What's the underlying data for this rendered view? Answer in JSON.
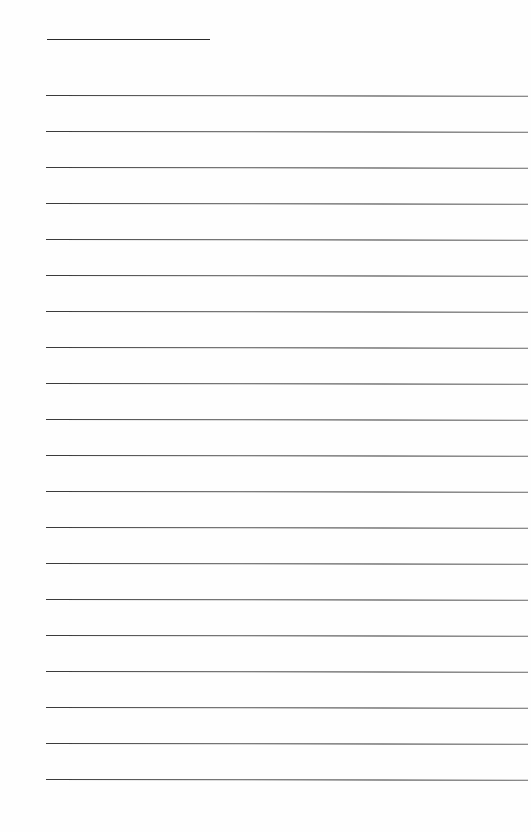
{
  "page": {
    "type": "blank ruled sheet",
    "title_line": {
      "x": 47,
      "y": 39,
      "width": 163,
      "color": "#2a2a2a"
    },
    "ruled_lines": {
      "count": 20,
      "start_y": 95,
      "spacing": 36,
      "x": 46,
      "width": 482,
      "color": "#444444"
    },
    "background": "#fefefe"
  }
}
